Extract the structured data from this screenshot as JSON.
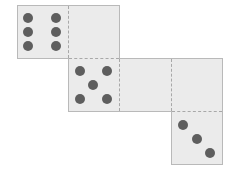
{
  "diagram": {
    "type": "cube-net",
    "face_color": "#ebebeb",
    "pip_color": "#5e5e5e",
    "edge_color": "#b9b9b9",
    "faces": [
      {
        "row": 0,
        "col": 0,
        "pips": 6
      },
      {
        "row": 0,
        "col": 1,
        "pips": 0
      },
      {
        "row": 1,
        "col": 1,
        "pips": 5
      },
      {
        "row": 1,
        "col": 2,
        "pips": 0
      },
      {
        "row": 1,
        "col": 3,
        "pips": 0
      },
      {
        "row": 2,
        "col": 3,
        "pips": 3
      }
    ],
    "fold_lines": "dashed",
    "outline": "solid"
  }
}
